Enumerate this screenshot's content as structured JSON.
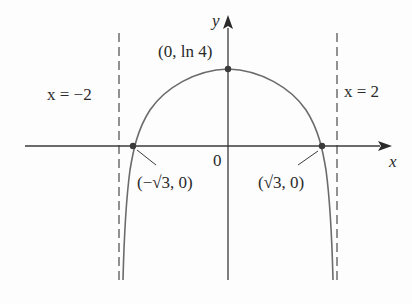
{
  "diagram": {
    "function": "y = ln(4 - x^2)",
    "axes": {
      "x_label": "x",
      "y_label": "y",
      "origin_label": "0"
    },
    "asymptotes": [
      {
        "label": "x = −2",
        "value": -2
      },
      {
        "label": "x = 2",
        "value": 2
      }
    ],
    "points": [
      {
        "label": "(0, ln 4)",
        "x": 0,
        "y": 1.386
      },
      {
        "label": "(−√3, 0)",
        "x": -1.732,
        "y": 0
      },
      {
        "label": "(√3, 0)",
        "x": 1.732,
        "y": 0
      }
    ],
    "colors": {
      "curve": "#6b6b6b",
      "axis": "#3a3a3a",
      "asymptote": "#3a3a3a",
      "point": "#3a3a3a"
    }
  },
  "labels": {
    "x_axis": "x",
    "y_axis": "y",
    "origin": "0",
    "left_asymptote": "x = −2",
    "right_asymptote": "x = 2",
    "max_point": "(0, ln 4)",
    "left_intercept": "(−√3, 0)",
    "right_intercept": "(√3, 0)"
  }
}
